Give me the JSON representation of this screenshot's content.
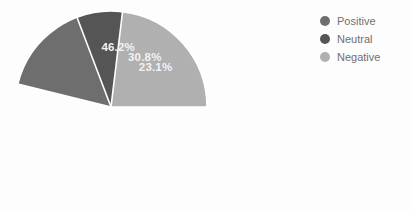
{
  "chart_data": {
    "type": "pie",
    "title": "",
    "labels": [
      "Positive",
      "Neutral",
      "Negative"
    ],
    "values": [
      46.2,
      30.8,
      23.1
    ],
    "display_values": [
      "46.2%",
      "30.8%",
      "23.1%"
    ],
    "colors": [
      "#6e6e6e",
      "#555555",
      "#b0b0b0"
    ],
    "autopct_format": "%.1f%%",
    "label_text_color": "#f2f2f2",
    "wedge_edge_color": "#ffffff",
    "start_angle_deg": 0,
    "direction": "counterclockwise",
    "legend": {
      "position": "right",
      "entries": [
        {
          "label": "Positive",
          "color": "#6e6e6e"
        },
        {
          "label": "Neutral",
          "color": "#555555"
        },
        {
          "label": "Negative",
          "color": "#b0b0b0"
        }
      ]
    },
    "background_color": "#fdfdfd",
    "grid": false,
    "xlabel": "",
    "ylabel": ""
  },
  "figure": {
    "background": "#fdfdfd"
  }
}
